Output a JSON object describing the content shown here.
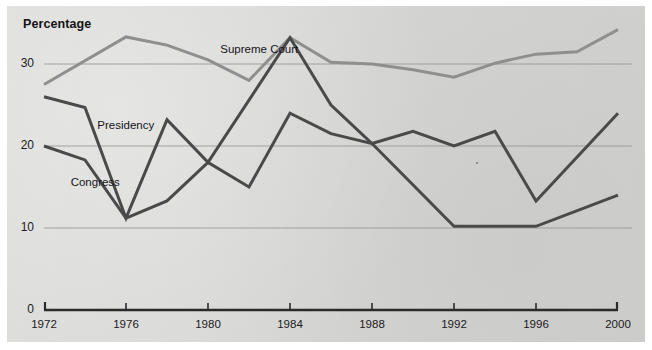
{
  "chart_data": {
    "type": "line",
    "title": "",
    "ylabel": "Percentage",
    "xlabel": "",
    "ylim": [
      0,
      36
    ],
    "xlim": [
      1972,
      2000
    ],
    "grid": true,
    "legend_position": "inline-annotations",
    "y_ticks": [
      "0",
      "10",
      "20",
      "30"
    ],
    "y_tick_values": [
      0,
      10,
      20,
      30
    ],
    "x_ticks": [
      "1972",
      "1976",
      "1980",
      "1984",
      "1988",
      "1992",
      "1996",
      "2000"
    ],
    "x_tick_values": [
      1972,
      1976,
      1980,
      1984,
      1988,
      1992,
      1996,
      2000
    ],
    "series": [
      {
        "name": "Supreme Court",
        "color": "#8f8f8f",
        "label_x": 1980.6,
        "label_y": 31.6,
        "x": [
          1972,
          1976,
          1978,
          1980,
          1982,
          1984,
          1986,
          1988,
          1990,
          1992,
          1994,
          1996,
          1998,
          2000
        ],
        "values": [
          27.5,
          33.3,
          32.3,
          30.5,
          28.0,
          33.2,
          30.2,
          30.0,
          29.3,
          28.4,
          30.1,
          31.2,
          31.5,
          34.2
        ]
      },
      {
        "name": "Presidency",
        "color": "#4a4a4a",
        "label_x": 1974.6,
        "label_y": 22.3,
        "x": [
          1972,
          1974,
          1976,
          1978,
          1980,
          1984,
          1986,
          1988,
          1990,
          1992,
          1994,
          1996,
          2000
        ],
        "values": [
          26.0,
          24.7,
          11.2,
          23.2,
          18.0,
          33.2,
          25.0,
          20.3,
          21.8,
          20.0,
          21.8,
          13.3,
          24.0
        ]
      },
      {
        "name": "Congress",
        "color": "#4a4a4a",
        "label_x": 1973.3,
        "label_y": 15.4,
        "x": [
          1972,
          1974,
          1976,
          1978,
          1980,
          1982,
          1984,
          1986,
          1988,
          1992,
          1996,
          2000
        ],
        "values": [
          20.0,
          18.3,
          11.2,
          13.3,
          18.0,
          15.0,
          24.0,
          21.5,
          20.3,
          10.2,
          10.2,
          14.0
        ]
      }
    ],
    "colors": {
      "background": "#d5d5d3",
      "axis": "#2b2b2b",
      "gridline": "#9a9a98",
      "supreme_court": "#8f8f8f",
      "presidency": "#4a4a4a",
      "congress": "#4a4a4a",
      "text": "#17171a"
    }
  }
}
